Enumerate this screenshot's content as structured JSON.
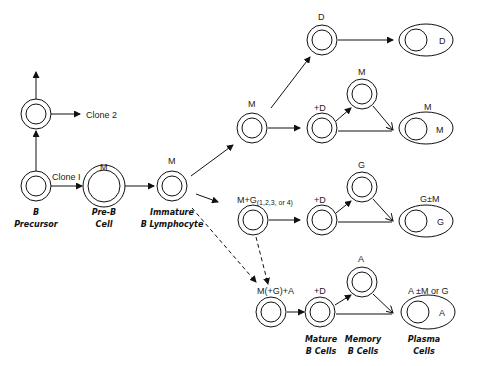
{
  "diagram": {
    "clones": {
      "clone1": "Clone I",
      "clone2": "Clone 2"
    },
    "stages": {
      "b_precursor": {
        "line1": "B",
        "line2": "Precursor"
      },
      "pre_b": {
        "line1": "Pre-B",
        "line2": "Cell",
        "label": "M"
      },
      "immature": {
        "line1": "Immature",
        "line2": "B Lymphocyte",
        "label": "M"
      },
      "mature": {
        "line1": "Mature",
        "line2": "B  Cells"
      },
      "memory": {
        "line1": "Memory",
        "line2": "B  Cells"
      },
      "plasma": {
        "line1": "Plasma",
        "line2": "Cells"
      }
    },
    "branches": {
      "d": {
        "cell_label": "D",
        "plasma_inner": "D"
      },
      "m": {
        "cell_label": "M",
        "mature_label": "+D",
        "memory_label": "M",
        "plasma_label": "M",
        "plasma_inner": "M"
      },
      "g": {
        "cell_label": "M+G",
        "subscript": "(1,2,3, or 4)",
        "mature_label": "+D",
        "memory_label": "G",
        "plasma_label": "G±M",
        "plasma_inner": "G"
      },
      "a": {
        "cell_label": "M(+G)+A",
        "mature_label": "+D",
        "memory_label": "A",
        "plasma_label": "A ±M or G",
        "plasma_inner": "A"
      }
    }
  }
}
